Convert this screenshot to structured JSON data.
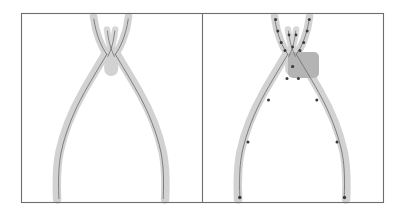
{
  "figure": {
    "kind": "two-panel-figure",
    "width": 405,
    "height": 216,
    "background_color": "#ffffff",
    "frame": {
      "x": 21,
      "y": 13,
      "width": 362,
      "height": 189,
      "stroke_color": "#6d6d70",
      "stroke_width": 1.1
    },
    "divider": {
      "x": 202,
      "y_top": 13,
      "y_bottom": 202,
      "stroke_color": "#6d6d70",
      "stroke_width": 1.1
    },
    "colors": {
      "shape_fill": "#d2d2d2",
      "shape_fill_light": "#dcdcdc",
      "skeleton_stroke": "#6f6f72",
      "node_marker": "#3a3a3c",
      "pivot_blob": "#b4b4b4",
      "frame_stroke": "#6d6d70",
      "background": "#ffffff"
    },
    "panels": [
      {
        "id": "panel-left",
        "name": "continuous-skeleton-panel",
        "object_depicted": "pliers",
        "has_node_markers": false,
        "has_pivot_blob": false,
        "origin_x": 21,
        "origin_y": 13,
        "width": 181,
        "height": 189
      },
      {
        "id": "panel-right",
        "name": "discrete-skeleton-panel",
        "object_depicted": "pliers",
        "has_node_markers": true,
        "has_pivot_blob": true,
        "origin_x": 202,
        "origin_y": 13,
        "width": 181,
        "height": 189
      }
    ],
    "shape_geometry": {
      "note": "Pliers rendered as thick light-gray strokes along branch paths; skeleton is the thin dark centerline of each branch.",
      "branches": [
        {
          "name": "left-jaw",
          "band_width": 7.5,
          "path": "M 93.5 16.5 C 94.6 25.0 96.6 33.0 99.4 40.2 C 101.4 45.4 103.6 49.6 106.0 53.2"
        },
        {
          "name": "right-jaw",
          "band_width": 7.5,
          "path": "M 128.6 16.5 C 127.6 25.0 125.6 33.0 122.8 40.2 C 120.8 45.4 118.6 49.6 116.2 53.2"
        },
        {
          "name": "left-inner-jaw",
          "band_width": 6.5,
          "path": "M 107.0 29.5 C 107.6 35.0 108.6 40.5 110.0 45.5 C 111.2 49.8 112.6 53.5 114.0 56.5"
        },
        {
          "name": "right-inner-jaw",
          "band_width": 6.5,
          "path": "M 115.2 29.5 C 114.6 35.0 113.6 40.5 112.2 45.5 C 111.0 49.8 109.6 53.5 108.2 56.5"
        },
        {
          "name": "pivot-body",
          "band_width": 14.0,
          "path": "M 111.2 52.0 L 111.2 70.0"
        },
        {
          "name": "left-handle",
          "band_width": 8.5,
          "path": "M 106.0 53.2 C 100.0 63.5 92.0 76.0 83.0 92.0 C 72.0 111.5 63.5 133.0 59.5 152.0 C 57.2 163.5 56.6 174.0 56.8 188.0 C 56.9 193.5 57.0 197.0 57.1 199.5"
        },
        {
          "name": "right-handle",
          "band_width": 8.5,
          "path": "M 116.2 53.2 C 122.2 63.5 130.2 76.0 139.2 92.0 C 150.2 111.5 158.7 133.0 162.7 152.0 C 165.0 163.5 165.6 174.0 165.4 188.0 C 165.3 193.5 165.2 197.0 165.1 199.5"
        }
      ],
      "skeleton_paths": [
        {
          "name": "left-jaw-axis",
          "path": "M 93.8 19.0 C 95.0 27.0 97.0 34.5 99.6 41.0 C 101.8 46.5 104.2 50.8 106.8 54.3"
        },
        {
          "name": "right-jaw-axis",
          "path": "M 128.3 19.0 C 127.1 27.0 125.1 34.5 122.5 41.0 C 120.3 46.5 117.9 50.8 115.3 54.3"
        },
        {
          "name": "left-inner-jaw-axis",
          "path": "M 107.4 31.0 C 108.0 36.5 109.0 41.5 110.3 46.0 C 111.5 50.0 112.9 53.5 114.3 56.4"
        },
        {
          "name": "right-inner-jaw-axis",
          "path": "M 114.8 31.0 C 114.2 36.5 113.2 41.5 111.9 46.0 C 110.7 50.0 109.3 53.5 107.9 56.4"
        },
        {
          "name": "left-handle-axis",
          "path": "M 106.8 54.3 C 101.0 64.3 93.2 76.6 84.4 92.4 C 73.6 111.7 65.2 133.0 61.2 152.0 C 59.0 163.4 58.4 174.0 58.6 188.0 C 58.7 193.5 58.8 196.5 58.9 198.6"
        },
        {
          "name": "right-handle-axis",
          "path": "M 115.3 54.3 C 121.1 64.3 128.9 76.6 137.7 92.4 C 148.5 111.7 156.9 133.0 160.9 152.0 C 163.1 163.4 163.7 174.0 163.5 188.0 C 163.4 193.5 163.3 196.5 163.2 198.6"
        }
      ],
      "right_panel_offset_x": 181,
      "pivot_blob": {
        "cx": 303.5,
        "cy": 65.0,
        "rx": 15.5,
        "ry": 13.0,
        "corner_radius": 5,
        "fill": "#b4b4b4"
      },
      "node_markers": [
        {
          "cx": 275.6,
          "cy": 19.5,
          "r": 1.5
        },
        {
          "cx": 277.8,
          "cy": 31.0,
          "r": 1.5
        },
        {
          "cx": 281.2,
          "cy": 42.5,
          "r": 1.5
        },
        {
          "cx": 285.0,
          "cy": 50.5,
          "r": 1.5
        },
        {
          "cx": 309.3,
          "cy": 19.5,
          "r": 1.5
        },
        {
          "cx": 307.1,
          "cy": 31.0,
          "r": 1.5
        },
        {
          "cx": 303.7,
          "cy": 42.5,
          "r": 1.5
        },
        {
          "cx": 299.9,
          "cy": 50.5,
          "r": 1.5
        },
        {
          "cx": 289.0,
          "cy": 35.0,
          "r": 1.4
        },
        {
          "cx": 296.0,
          "cy": 35.0,
          "r": 1.4
        },
        {
          "cx": 292.6,
          "cy": 47.0,
          "r": 1.4
        },
        {
          "cx": 292.6,
          "cy": 66.5,
          "r": 1.6
        },
        {
          "cx": 287.0,
          "cy": 78.5,
          "r": 1.5
        },
        {
          "cx": 298.4,
          "cy": 78.5,
          "r": 1.5
        },
        {
          "cx": 268.5,
          "cy": 100.0,
          "r": 1.5
        },
        {
          "cx": 316.8,
          "cy": 100.0,
          "r": 1.5
        },
        {
          "cx": 248.0,
          "cy": 142.0,
          "r": 1.5
        },
        {
          "cx": 337.0,
          "cy": 142.0,
          "r": 1.5
        },
        {
          "cx": 239.8,
          "cy": 197.5,
          "r": 1.7
        },
        {
          "cx": 344.5,
          "cy": 197.5,
          "r": 1.7
        }
      ]
    }
  }
}
